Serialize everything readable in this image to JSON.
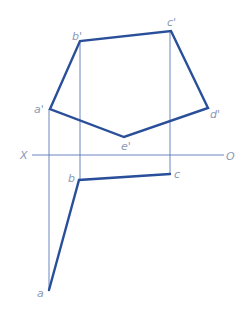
{
  "diagram": {
    "type": "orthographic projection (front and top views of a pentagon)",
    "axis": {
      "left_label": "X",
      "right_label": "O",
      "y": 155,
      "x1": 32,
      "x2": 224
    },
    "front_view": {
      "points": {
        "a'": [
          50,
          109
        ],
        "b'": [
          80,
          41
        ],
        "c'": [
          171,
          31
        ],
        "d'": [
          208,
          108
        ],
        "e'": [
          124,
          137
        ]
      },
      "outline_order": [
        "a'",
        "b'",
        "c'",
        "d'",
        "e'",
        "a'"
      ],
      "labels": {
        "a": "a'",
        "b": "b'",
        "c": "c'",
        "d": "d'",
        "e": "e'"
      }
    },
    "top_view": {
      "points": {
        "a": [
          49,
          290
        ],
        "b": [
          79,
          180
        ],
        "c": [
          170,
          174
        ]
      },
      "outline_order": [
        "a",
        "b",
        "c"
      ],
      "labels": {
        "a": "a",
        "b": "b",
        "c": "c"
      }
    },
    "projection_lines": [
      {
        "from": "a'",
        "x": 49,
        "y1": 109,
        "y2": 290
      },
      {
        "from": "b'",
        "x": 80,
        "y1": 41,
        "y2": 180
      },
      {
        "from": "c'",
        "x": 170,
        "y1": 31,
        "y2": 174
      }
    ],
    "colors": {
      "outline": "#2a4f9a",
      "projection": "#5a78b8",
      "label": "#8a9ab8"
    }
  }
}
